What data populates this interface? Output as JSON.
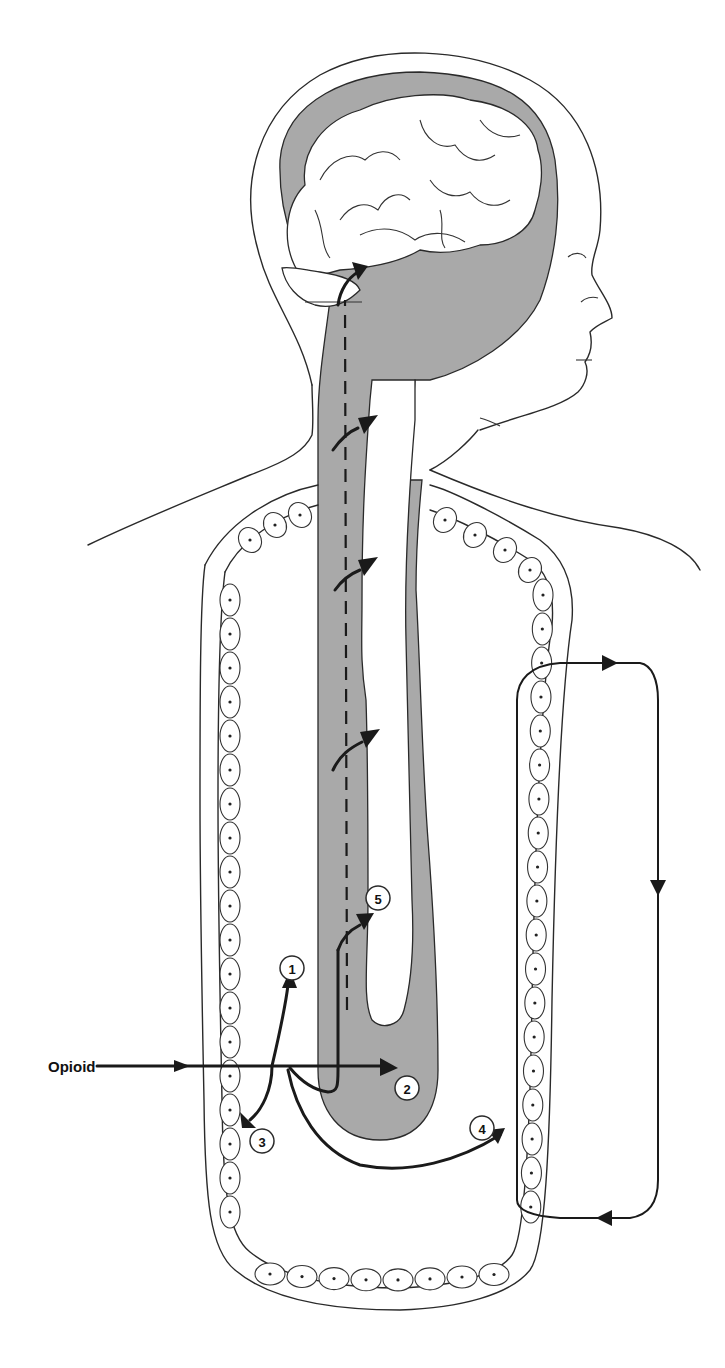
{
  "diagram": {
    "input_label": "Opioid",
    "markers": [
      {
        "id": "1",
        "label": "1"
      },
      {
        "id": "2",
        "label": "2"
      },
      {
        "id": "3",
        "label": "3"
      },
      {
        "id": "4",
        "label": "4"
      },
      {
        "id": "5",
        "label": "5"
      }
    ],
    "components": [
      "head-outline",
      "brain",
      "cerebrospinal-fluid-space",
      "spinal-canal",
      "gut-epithelium",
      "systemic-circulation-loop"
    ],
    "colors": {
      "shading": "#a9a9a9",
      "ink": "#1a1a1a",
      "background": "#ffffff"
    }
  }
}
